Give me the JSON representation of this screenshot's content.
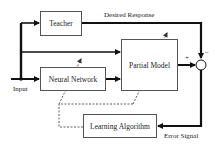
{
  "diagram": {
    "blocks": {
      "teacher": "Teacher",
      "partial_model": "Partial Model",
      "neural_network": "Neural Network",
      "learning_algorithm": "Learning Algorithm"
    },
    "labels": {
      "input": "Input",
      "desired_response": "Desired Response",
      "error_signal": "Error Signal",
      "plus": "+",
      "minus": "−"
    },
    "colors": {
      "line": "#111111",
      "box_border": "#555555",
      "dashed": "#333333"
    }
  }
}
